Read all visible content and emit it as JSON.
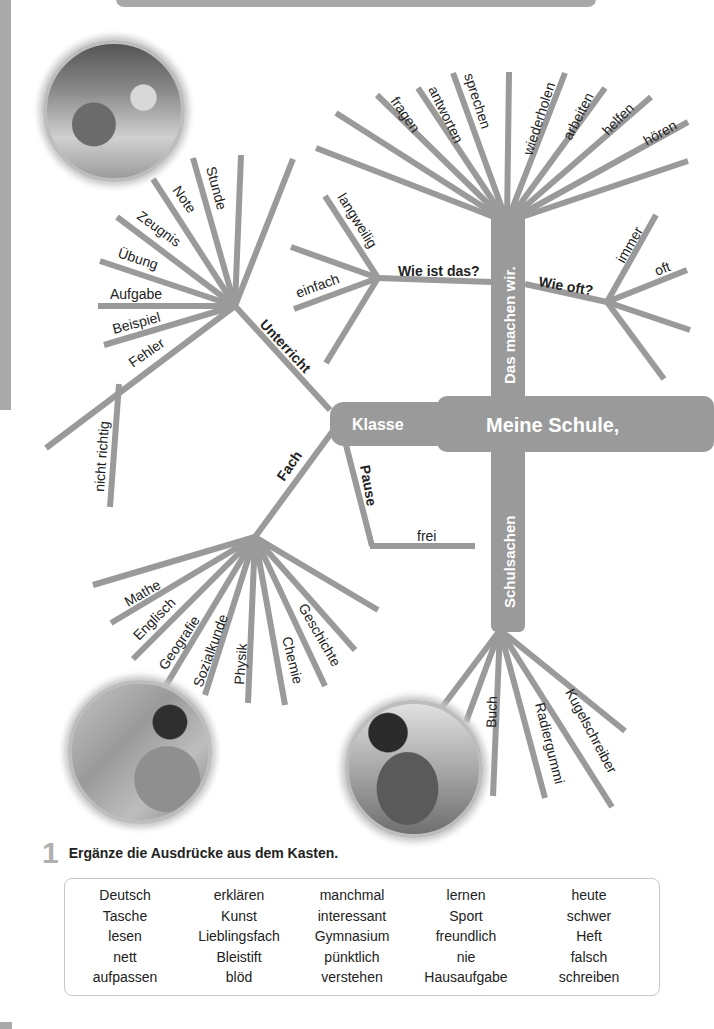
{
  "mindmap": {
    "center": "Meine Schule,",
    "klasse": "Klasse",
    "branches": {
      "das_machen_wir": {
        "label": "Das machen wir.",
        "words": [
          "fragen",
          "antworten",
          "sprechen",
          "wiederholen",
          "arbeiten",
          "helfen",
          "hören"
        ],
        "wie_ist_das": {
          "label": "Wie ist das?",
          "words": [
            "langweilig",
            "einfach"
          ]
        },
        "wie_oft": {
          "label": "Wie oft?",
          "words": [
            "immer",
            "oft"
          ]
        }
      },
      "unterricht": {
        "label": "Unterricht",
        "words": [
          "Stunde",
          "Note",
          "Zeugnis",
          "Übung",
          "Aufgabe",
          "Beispiel",
          "Fehler",
          "nicht richtig"
        ]
      },
      "fach": {
        "label": "Fach",
        "words": [
          "Mathe",
          "Englisch",
          "Geografie",
          "Sozialkunde",
          "Physik",
          "Chemie",
          "Geschichte"
        ]
      },
      "pause": {
        "label": "Pause",
        "words": [
          "frei"
        ]
      },
      "schulsachen": {
        "label": "Schulsachen",
        "words": [
          "Buch",
          "Radiergummi",
          "Kugelschreiber"
        ]
      }
    },
    "colors": {
      "branch": "#9a9a9a",
      "text": "#222222",
      "trunk_text": "#ffffff"
    }
  },
  "photos": [
    {
      "name": "classroom-children-photo"
    },
    {
      "name": "boy-at-map-photo"
    },
    {
      "name": "friends-hugging-photo"
    }
  ],
  "exercise": {
    "number": "1",
    "instruction": "Ergänze die Ausdrücke aus dem Kasten.",
    "words": [
      "Deutsch",
      "erklären",
      "manchmal",
      "lernen",
      "heute",
      "Tasche",
      "Kunst",
      "interessant",
      "Sport",
      "schwer",
      "lesen",
      "Lieblingsfach",
      "Gymnasium",
      "freundlich",
      "Heft",
      "nett",
      "Bleistift",
      "pünktlich",
      "nie",
      "falsch",
      "aufpassen",
      "blöd",
      "verstehen",
      "Hausaufgabe",
      "schreiben"
    ]
  }
}
